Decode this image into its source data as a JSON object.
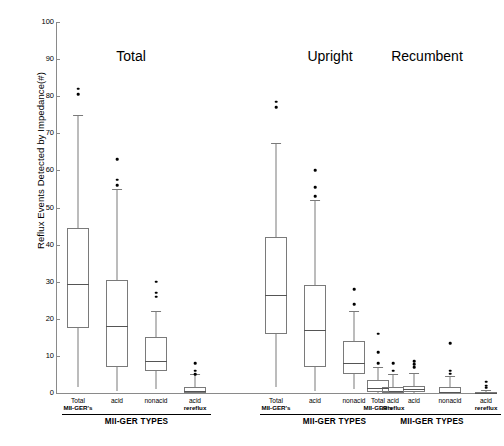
{
  "chart_data": {
    "type": "box",
    "title": "",
    "ylabel": "Reflux Events Detected by Impedance(#)",
    "xlabel": "MII-GER TYPES",
    "ylim": [
      0,
      100
    ],
    "yticks": [
      0,
      10,
      20,
      30,
      40,
      50,
      60,
      70,
      80,
      90,
      100
    ],
    "grid": false,
    "legend": "none",
    "panels": [
      {
        "title": "Total",
        "categories": [
          "Total MII-GER's",
          "acid",
          "nonacid",
          "acid rereflux"
        ],
        "boxes": [
          {
            "label": "Total MII-GER's",
            "label_line1": "Total",
            "label_line2": "MII-GER's",
            "whisker_low": 1.5,
            "q1": 17.5,
            "median": 29.5,
            "q3": 44.5,
            "whisker_high": 75.0,
            "outliers": [
              82.0,
              80.5
            ]
          },
          {
            "label": "acid",
            "label_line1": "acid",
            "label_line2": "",
            "whisker_low": 0.5,
            "q1": 7.0,
            "median": 18.0,
            "q3": 30.5,
            "whisker_high": 55.0,
            "outliers": [
              63.0,
              57.5,
              56.0
            ]
          },
          {
            "label": "nonacid",
            "label_line1": "nonacid",
            "label_line2": "",
            "whisker_low": 1.0,
            "q1": 6.0,
            "median": 8.5,
            "q3": 15.0,
            "whisker_high": 22.0,
            "outliers": [
              30.0,
              27.0,
              26.0
            ]
          },
          {
            "label": "acid rereflux",
            "label_line1": "acid",
            "label_line2": "rereflux",
            "whisker_low": 0.0,
            "q1": 0.0,
            "median": 0.6,
            "q3": 1.5,
            "whisker_high": 5.0,
            "outliers": [
              8.0,
              6.0,
              5.0
            ]
          }
        ]
      },
      {
        "title": "Upright",
        "categories": [
          "Total MII-GER's",
          "acid",
          "nonacid",
          "acid rereflux"
        ],
        "boxes": [
          {
            "label": "Total MII-GER's",
            "label_line1": "Total",
            "label_line2": "MII-GER's",
            "whisker_low": 1.5,
            "q1": 16.0,
            "median": 26.5,
            "q3": 42.0,
            "whisker_high": 67.5,
            "outliers": [
              78.5,
              77.0
            ]
          },
          {
            "label": "acid",
            "label_line1": "acid",
            "label_line2": "",
            "whisker_low": 0.5,
            "q1": 7.0,
            "median": 17.0,
            "q3": 29.0,
            "whisker_high": 52.0,
            "outliers": [
              60.0,
              55.5,
              53.0
            ]
          },
          {
            "label": "nonacid",
            "label_line1": "nonacid",
            "label_line2": "",
            "whisker_low": 1.0,
            "q1": 5.0,
            "median": 8.0,
            "q3": 14.0,
            "whisker_high": 22.0,
            "outliers": [
              28.0,
              24.0
            ]
          },
          {
            "label": "acid rereflux",
            "label_line1": "acid",
            "label_line2": "rereflux",
            "whisker_low": 0.0,
            "q1": 0.0,
            "median": 0.6,
            "q3": 1.5,
            "whisker_high": 5.0,
            "outliers": [
              8.0,
              6.0
            ]
          }
        ]
      },
      {
        "title": "Recumbent",
        "categories": [
          "Total MII-GER's",
          "acid",
          "nonacid",
          "acid rereflux"
        ],
        "boxes": [
          {
            "label": "Total MII-GER's",
            "label_line1": "Total",
            "label_line2": "MII-GER's",
            "whisker_low": 0.0,
            "q1": 0.3,
            "median": 1.4,
            "q3": 3.5,
            "whisker_high": 7.0,
            "outliers": [
              16.0,
              11.0,
              8.0
            ]
          },
          {
            "label": "acid",
            "label_line1": "acid",
            "label_line2": "",
            "whisker_low": 0.0,
            "q1": 0.2,
            "median": 1.0,
            "q3": 2.0,
            "whisker_high": 5.5,
            "outliers": [
              8.5,
              7.8,
              7.0
            ]
          },
          {
            "label": "nonacid",
            "label_line1": "nonacid",
            "label_line2": "",
            "whisker_low": 0.0,
            "q1": 0.0,
            "median": 0.4,
            "q3": 1.5,
            "whisker_high": 4.5,
            "outliers": [
              13.5,
              6.0,
              5.2
            ]
          },
          {
            "label": "acid rereflux",
            "label_line1": "acid",
            "label_line2": "rereflux",
            "whisker_low": 0.0,
            "q1": 0.0,
            "median": 0.1,
            "q3": 0.3,
            "whisker_high": 0.8,
            "outliers": [
              3.0,
              2.0,
              1.4
            ]
          }
        ]
      }
    ]
  }
}
